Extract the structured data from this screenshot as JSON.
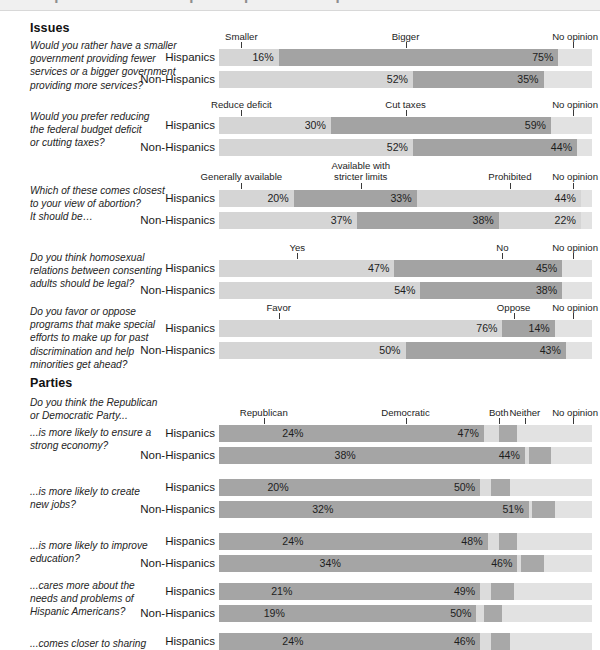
{
  "topstrip": {
    "ghost_text": "Hispanic and non-Hispanic opinions compared"
  },
  "sections": [
    {
      "id": "issues",
      "label": "Issues"
    },
    {
      "id": "parties",
      "label": "Parties"
    }
  ],
  "group_labels": {
    "hispanics": "Hispanics",
    "non_hispanics": "Non-Hispanics"
  },
  "parties_intro": [
    "Do you think the Republican",
    "or Democratic Party..."
  ],
  "chart_data": {
    "type": "bar",
    "orientation": "horizontal-stacked",
    "xlim": [
      0,
      100
    ],
    "units": "percent",
    "grid": false,
    "legend_position": "above-bars-as-column-headers",
    "groups": [
      "Hispanics",
      "Non-Hispanics"
    ],
    "blocks": [
      {
        "section": "Issues",
        "question": [
          "Would you rather have a smaller",
          "government providing fewer",
          "services or a bigger government",
          "providing more services?"
        ],
        "categories": [
          "Smaller",
          "Bigger",
          "No opinion"
        ],
        "header_positions": [
          6,
          50,
          95
        ],
        "series": [
          {
            "name": "Hispanics",
            "values": [
              16,
              75,
              9
            ],
            "labels": [
              "16%",
              "75%",
              ""
            ]
          },
          {
            "name": "Non-Hispanics",
            "values": [
              52,
              35,
              13
            ],
            "labels": [
              "52%",
              "35%",
              ""
            ]
          }
        ]
      },
      {
        "section": "Issues",
        "question": [
          "Would you prefer reducing",
          "the federal budget deficit",
          "or cutting taxes?"
        ],
        "categories": [
          "Reduce deficit",
          "Cut taxes",
          "No opinion"
        ],
        "header_positions": [
          6,
          50,
          95
        ],
        "series": [
          {
            "name": "Hispanics",
            "values": [
              30,
              59,
              11
            ],
            "labels": [
              "30%",
              "59%",
              ""
            ]
          },
          {
            "name": "Non-Hispanics",
            "values": [
              52,
              44,
              4
            ],
            "labels": [
              "52%",
              "44%",
              ""
            ]
          }
        ]
      },
      {
        "section": "Issues",
        "question": [
          "Which of these comes closest",
          "to your view  of abortion?",
          "It should be…"
        ],
        "categories": [
          "Generally available",
          "Available with stricter limits",
          "Prohibited",
          "No opinion"
        ],
        "header_positions": [
          6,
          38,
          78,
          95
        ],
        "series": [
          {
            "name": "Hispanics",
            "values": [
              20,
              33,
              44,
              3
            ],
            "labels": [
              "20%",
              "33%",
              "44%",
              ""
            ]
          },
          {
            "name": "Non-Hispanics",
            "values": [
              37,
              38,
              22,
              3
            ],
            "labels": [
              "37%",
              "38%",
              "22%",
              ""
            ]
          }
        ]
      },
      {
        "section": "Issues",
        "question": [
          "Do you think homosexual",
          "relations between consenting",
          "adults should be legal?"
        ],
        "categories": [
          "Yes",
          "No",
          "No opinion"
        ],
        "header_positions": [
          21,
          76,
          95
        ],
        "series": [
          {
            "name": "Hispanics",
            "values": [
              47,
              45,
              8
            ],
            "labels": [
              "47%",
              "45%",
              ""
            ]
          },
          {
            "name": "Non-Hispanics",
            "values": [
              54,
              38,
              8
            ],
            "labels": [
              "54%",
              "38%",
              ""
            ]
          }
        ]
      },
      {
        "section": "Issues",
        "question": [
          "Do you favor or oppose",
          "programs that make special",
          "efforts to make up for past",
          "discrimination and help",
          "minorities get ahead?"
        ],
        "categories": [
          "Favor",
          "Oppose",
          "No opinion"
        ],
        "header_positions": [
          16,
          79,
          95
        ],
        "series": [
          {
            "name": "Hispanics",
            "values": [
              76,
              14,
              10
            ],
            "labels": [
              "76%",
              "14%",
              ""
            ]
          },
          {
            "name": "Non-Hispanics",
            "values": [
              50,
              43,
              7
            ],
            "labels": [
              "50%",
              "43%",
              ""
            ]
          }
        ]
      },
      {
        "section": "Parties",
        "question": [
          "...is more likely to ensure a",
          "strong economy?"
        ],
        "categories": [
          "Republican",
          "Democratic",
          "Both",
          "Neither",
          "No opinion"
        ],
        "header_positions": [
          12,
          50,
          75,
          82,
          95
        ],
        "series": [
          {
            "name": "Hispanics",
            "values": [
              24,
              47,
              4,
              5,
              20
            ],
            "labels": [
              "24%",
              "47%",
              "",
              "",
              ""
            ]
          },
          {
            "name": "Non-Hispanics",
            "values": [
              38,
              44,
              1,
              6,
              11
            ],
            "labels": [
              "38%",
              "44%",
              "",
              "",
              ""
            ]
          }
        ]
      },
      {
        "section": "Parties",
        "question": [
          "...is more likely to create",
          "new jobs?"
        ],
        "categories": [
          "Republican",
          "Democratic",
          "Both",
          "Neither",
          "No opinion"
        ],
        "header_positions": [
          12,
          50,
          75,
          82,
          95
        ],
        "series": [
          {
            "name": "Hispanics",
            "values": [
              20,
              50,
              3,
              5,
              22
            ],
            "labels": [
              "20%",
              "50%",
              "",
              "",
              ""
            ]
          },
          {
            "name": "Non-Hispanics",
            "values": [
              32,
              51,
              1,
              6,
              10
            ],
            "labels": [
              "32%",
              "51%",
              "",
              "",
              ""
            ]
          }
        ]
      },
      {
        "section": "Parties",
        "question": [
          "...is more likely to improve",
          "education?"
        ],
        "categories": [
          "Republican",
          "Democratic",
          "Both",
          "Neither",
          "No opinion"
        ],
        "header_positions": [
          12,
          50,
          75,
          82,
          95
        ],
        "series": [
          {
            "name": "Hispanics",
            "values": [
              24,
              48,
              3,
              5,
              20
            ],
            "labels": [
              "24%",
              "48%",
              "",
              "",
              ""
            ]
          },
          {
            "name": "Non-Hispanics",
            "values": [
              34,
              46,
              1,
              6,
              13
            ],
            "labels": [
              "34%",
              "46%",
              "",
              "",
              ""
            ]
          }
        ]
      },
      {
        "section": "Parties",
        "question": [
          "...cares more about the",
          "needs and problems of",
          "Hispanic Americans?"
        ],
        "categories": [
          "Republican",
          "Democratic",
          "Both",
          "Neither",
          "No opinion"
        ],
        "header_positions": [
          12,
          50,
          75,
          82,
          95
        ],
        "series": [
          {
            "name": "Hispanics",
            "values": [
              21,
              49,
              3,
              6,
              21
            ],
            "labels": [
              "21%",
              "49%",
              "",
              "",
              ""
            ]
          },
          {
            "name": "Non-Hispanics",
            "values": [
              19,
              50,
              2,
              5,
              24
            ],
            "labels": [
              "19%",
              "50%",
              "",
              "",
              ""
            ]
          }
        ]
      },
      {
        "section": "Parties",
        "question": [
          "...comes closer to sharing"
        ],
        "categories": [
          "Republican",
          "Democratic",
          "Both",
          "Neither",
          "No opinion"
        ],
        "header_positions": [
          12,
          50,
          75,
          82,
          95
        ],
        "series": [
          {
            "name": "Hispanics",
            "values": [
              24,
              46,
              3,
              5,
              22
            ],
            "labels": [
              "24%",
              "46%",
              "",
              "",
              ""
            ]
          }
        ]
      }
    ]
  },
  "colors": {
    "light": "#d5d5d5",
    "medium": "#a3a3a3",
    "tail": "#dcdcdc",
    "neither": "#a8a8a8",
    "no_opinion": "#e2e2e2",
    "parties_main": "#a5a5a5",
    "text": "#1a1a1a",
    "page_bg": "#ffffff"
  }
}
